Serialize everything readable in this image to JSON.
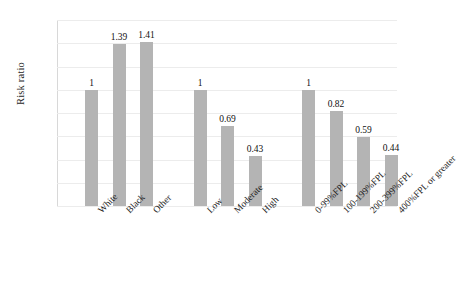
{
  "chart_data": {
    "type": "bar",
    "title": "",
    "xlabel": "",
    "ylabel": "Risk ratio",
    "ylim": [
      0,
      1.6
    ],
    "ytick_step": 0.2,
    "ytick_labels": [
      "1.6",
      "1.4",
      "1.2",
      "1",
      "0.8",
      "0.6",
      "0.4",
      "0.2",
      "0"
    ],
    "ytick_values": [
      1.6,
      1.4,
      1.2,
      1,
      0.8,
      0.6,
      0.4,
      0.2,
      0
    ],
    "grid": true,
    "grid_axis": "y",
    "legend": false,
    "legend_position": "none",
    "bar_color": "#b4b4b4",
    "grid_color": "#ececec",
    "axis_color": "#d8d8d8",
    "categories": [
      "White",
      "Black",
      "Other",
      "Low",
      "Moderate",
      "High",
      "0-99%FPL",
      "100-199%FPL",
      "200-399%FPL",
      "400%FPL or greater"
    ],
    "values": [
      1,
      1.39,
      1.41,
      1,
      0.69,
      0.43,
      1,
      0.82,
      0.59,
      0.44
    ],
    "value_labels": [
      "1",
      "1.39",
      "1.41",
      "1",
      "0.69",
      "0.43",
      "1",
      "0.82",
      "0.59",
      "0.44"
    ],
    "groups": [
      {
        "name": "Race/ethnicity",
        "categories": [
          "White",
          "Black",
          "Other"
        ],
        "values": [
          1,
          1.39,
          1.41
        ]
      },
      {
        "name": "Risk level",
        "categories": [
          "Low",
          "Moderate",
          "High"
        ],
        "values": [
          1,
          0.69,
          0.43
        ]
      },
      {
        "name": "Federal poverty level",
        "categories": [
          "0-99%FPL",
          "100-199%FPL",
          "200-399%FPL",
          "400%FPL or greater"
        ],
        "values": [
          1,
          0.82,
          0.59,
          0.44
        ]
      }
    ]
  }
}
